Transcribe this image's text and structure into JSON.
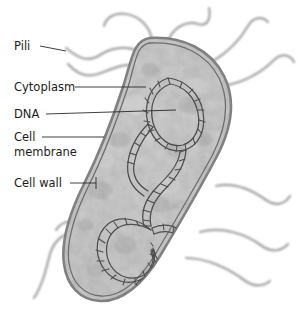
{
  "diagram": {
    "labels": [
      {
        "id": "pili",
        "text": "Pili",
        "x": 14,
        "y": 46
      },
      {
        "id": "cytoplasm",
        "text": "Cytoplasm",
        "x": 14,
        "y": 87
      },
      {
        "id": "dna",
        "text": "DNA",
        "x": 14,
        "y": 114
      },
      {
        "id": "cell-membrane",
        "text": "Cell",
        "text2": "membrane",
        "x": 14,
        "y": 142
      },
      {
        "id": "cell-wall",
        "text": "Cell wall",
        "x": 14,
        "y": 183
      }
    ],
    "colors": {
      "background": "#ffffff",
      "cytoplasm_light": "#d2d2d2",
      "cytoplasm_mid": "#bdbdbd",
      "cytoplasm_dark": "#a9a9a9",
      "cell_wall_outer": "#8f8f8f",
      "cell_membrane_line": "#6e6e6e",
      "dna_stroke": "#4a4a4a",
      "pili_stroke": "#9a9a9a",
      "label_text": "#1c1c1c",
      "leader_line": "#2a2a2a"
    },
    "structures": [
      {
        "name": "cell wall",
        "description": "outer double boundary line of the rod-shaped cell"
      },
      {
        "name": "cell membrane",
        "description": "inner boundary line just inside the cell wall"
      },
      {
        "name": "cytoplasm",
        "description": "mottled gray interior filling the cell"
      },
      {
        "name": "DNA",
        "description": "long coiled double-helix nucleoid loop inside the cytoplasm"
      },
      {
        "name": "pili",
        "description": "wavy hair-like filaments projecting from the cell surface"
      }
    ],
    "pili_count": 9
  }
}
